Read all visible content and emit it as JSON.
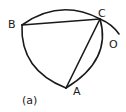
{
  "figure": {
    "caption": "(a)",
    "points": {
      "A": "A",
      "B": "B",
      "C": "C",
      "O": "O"
    }
  }
}
